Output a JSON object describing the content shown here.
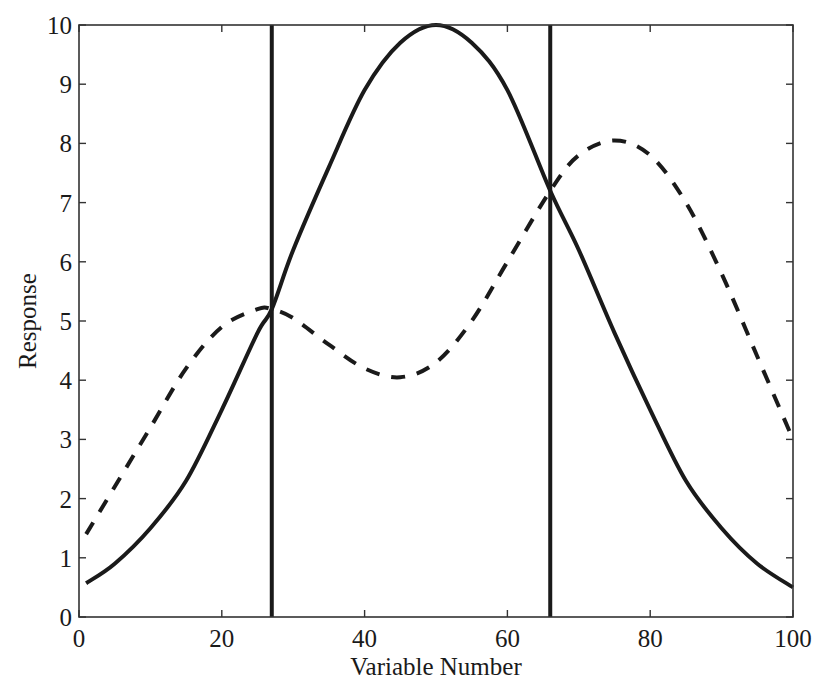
{
  "chart_data": {
    "type": "line",
    "title": "",
    "xlabel": "Variable Number",
    "ylabel": "Response",
    "xlim": [
      0,
      100
    ],
    "ylim": [
      0,
      10
    ],
    "xticks": [
      0,
      20,
      40,
      60,
      80,
      100
    ],
    "yticks": [
      0,
      1,
      2,
      3,
      4,
      5,
      6,
      7,
      8,
      9,
      10
    ],
    "xtick_labels": [
      "0",
      "20",
      "40",
      "60",
      "80",
      "100"
    ],
    "ytick_labels": [
      "0",
      "1",
      "2",
      "3",
      "4",
      "5",
      "6",
      "7",
      "8",
      "9",
      "10"
    ],
    "grid": false,
    "legend": null,
    "x": [
      1,
      5,
      10,
      15,
      20,
      25,
      27,
      30,
      35,
      40,
      45,
      50,
      55,
      60,
      66,
      70,
      75,
      80,
      85,
      90,
      95,
      100
    ],
    "series": [
      {
        "name": "solid",
        "style": "solid",
        "color": "#1a1a1a",
        "values": [
          0.57,
          0.9,
          1.5,
          2.3,
          3.5,
          4.8,
          5.2,
          6.2,
          7.6,
          8.9,
          9.7,
          10.0,
          9.7,
          8.9,
          7.2,
          6.2,
          4.8,
          3.5,
          2.3,
          1.5,
          0.9,
          0.5
        ]
      },
      {
        "name": "dashed",
        "style": "dashed",
        "color": "#1a1a1a",
        "values": [
          1.4,
          2.2,
          3.2,
          4.2,
          4.9,
          5.2,
          5.2,
          5.05,
          4.6,
          4.2,
          4.05,
          4.3,
          5.0,
          6.0,
          7.2,
          7.8,
          8.05,
          7.8,
          7.0,
          5.8,
          4.4,
          3.0
        ]
      }
    ],
    "vertical_lines": [
      27,
      66
    ]
  }
}
